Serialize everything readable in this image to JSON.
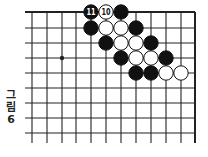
{
  "figure": {
    "caption_chars": [
      "그",
      "림",
      "6"
    ],
    "caption": "그림 6"
  },
  "board": {
    "grid": {
      "columns_x": [
        32,
        47,
        62,
        76,
        91,
        106,
        121,
        136,
        151,
        166,
        181,
        195
      ],
      "rows_y": [
        12,
        28,
        43,
        58,
        73,
        88,
        103,
        118,
        133
      ],
      "left_extend": 25,
      "bottom_extend": 143,
      "top_edge": true,
      "right_edge": true
    },
    "star_points": [
      {
        "col": 2,
        "row": 3
      }
    ],
    "stones": [
      {
        "col": 4,
        "row": 0,
        "color": "black",
        "label": "11"
      },
      {
        "col": 5,
        "row": 0,
        "color": "white",
        "label": "10"
      },
      {
        "col": 6,
        "row": 0,
        "color": "black",
        "label": ""
      },
      {
        "col": 4,
        "row": 1,
        "color": "black",
        "label": ""
      },
      {
        "col": 5,
        "row": 1,
        "color": "white",
        "label": ""
      },
      {
        "col": 6,
        "row": 1,
        "color": "white",
        "label": ""
      },
      {
        "col": 7,
        "row": 1,
        "color": "black",
        "label": ""
      },
      {
        "col": 5,
        "row": 2,
        "color": "black",
        "label": ""
      },
      {
        "col": 6,
        "row": 2,
        "color": "white",
        "label": ""
      },
      {
        "col": 7,
        "row": 2,
        "color": "white",
        "label": ""
      },
      {
        "col": 8,
        "row": 2,
        "color": "black",
        "label": ""
      },
      {
        "col": 6,
        "row": 3,
        "color": "black",
        "label": ""
      },
      {
        "col": 7,
        "row": 3,
        "color": "white",
        "label": ""
      },
      {
        "col": 8,
        "row": 3,
        "color": "white",
        "label": ""
      },
      {
        "col": 9,
        "row": 3,
        "color": "black",
        "label": ""
      },
      {
        "col": 7,
        "row": 4,
        "color": "black",
        "label": ""
      },
      {
        "col": 8,
        "row": 4,
        "color": "black",
        "label": ""
      },
      {
        "col": 9,
        "row": 4,
        "color": "white",
        "label": ""
      },
      {
        "col": 10,
        "row": 4,
        "color": "white",
        "label": ""
      }
    ],
    "colors": {
      "line": "#222222",
      "black_stone": "#111111",
      "white_stone": "#ffffff"
    }
  }
}
